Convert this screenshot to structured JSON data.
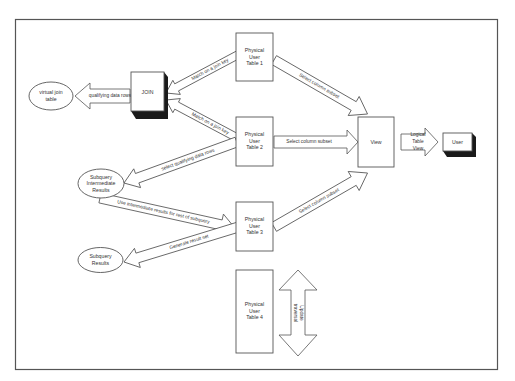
{
  "diagram": {
    "nodes": {
      "virtual_join_table": {
        "lines": [
          "virtual join",
          "table"
        ]
      },
      "join": {
        "lines": [
          "JOIN"
        ]
      },
      "table1": {
        "lines": [
          "Physical",
          "User",
          "Table 1"
        ]
      },
      "table2": {
        "lines": [
          "Physical",
          "User",
          "Table 2"
        ]
      },
      "table3": {
        "lines": [
          "Physical",
          "User",
          "Table 3"
        ]
      },
      "table4": {
        "lines": [
          "Physical",
          "User",
          "Table 4"
        ]
      },
      "view": {
        "lines": [
          "View"
        ]
      },
      "user": {
        "lines": [
          "User"
        ]
      },
      "subquery_intermediate": {
        "lines": [
          "Subquery",
          "Intermediate",
          "Results"
        ]
      },
      "subquery_results": {
        "lines": [
          "Subquery",
          "Results"
        ]
      }
    },
    "arrows": {
      "join_to_virtual": "qualifying data rows",
      "table1_to_join": "Match on a join key",
      "table2_to_join": "Match on a join key",
      "table1_to_view": "Select column subset",
      "table2_to_view": "Select column subset",
      "table3_to_view": "Select column subset",
      "table2_to_subquery": "select qualifying data rows",
      "subquery_to_table3": "Use intermediate results for rest of subquery",
      "table3_to_results": "Generate result set",
      "view_to_user": [
        "Logical",
        "Table",
        "View"
      ],
      "table4_traversal": [
        "Update",
        "traversal"
      ]
    }
  }
}
